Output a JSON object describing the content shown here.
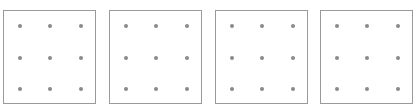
{
  "figure": {
    "panel_count": 4,
    "rows": 3,
    "columns": 3,
    "colors": {
      "border": "#9a9a9a",
      "dot": "#8a8a8a",
      "background": "#ffffff"
    },
    "panels": [
      {
        "id": "panel-1",
        "left": 3
      },
      {
        "id": "panel-2",
        "left": 109
      },
      {
        "id": "panel-3",
        "left": 215
      },
      {
        "id": "panel-4",
        "left": 320
      }
    ],
    "dot_offsets_x": [
      16,
      46,
      77
    ],
    "dot_offsets_y": [
      15,
      47,
      78
    ]
  }
}
